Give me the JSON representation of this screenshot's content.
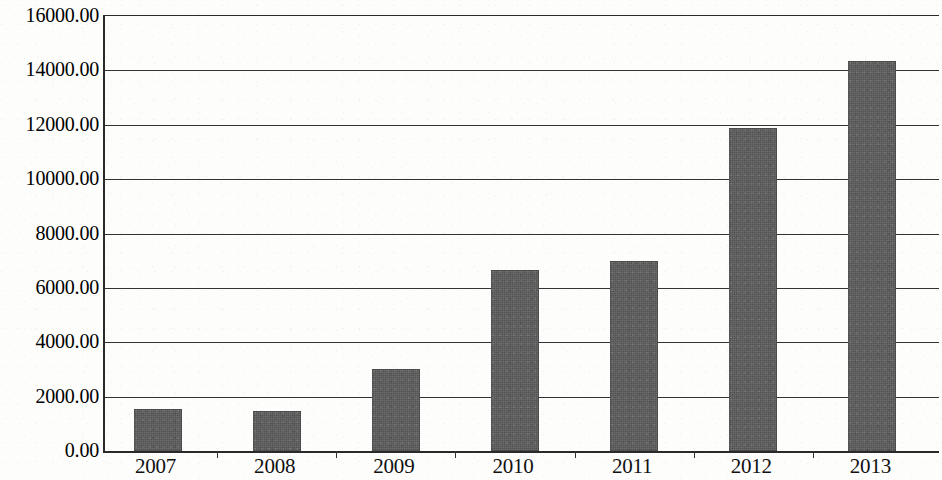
{
  "chart_data": {
    "type": "bar",
    "title": "",
    "subtitle": "",
    "xlabel": "",
    "ylabel": "",
    "categories": [
      "2007",
      "2008",
      "2009",
      "2010",
      "2011",
      "2012",
      "2013"
    ],
    "values": [
      1550,
      1480,
      3020,
      6650,
      7000,
      11880,
      14350
    ],
    "series": [
      {
        "name": "",
        "values": [
          1550,
          1480,
          3020,
          6650,
          7000,
          11880,
          14350
        ]
      }
    ],
    "ylim": [
      0,
      16000
    ],
    "ytick_values": [
      0,
      2000,
      4000,
      6000,
      8000,
      10000,
      12000,
      14000,
      16000
    ],
    "ytick_labels": [
      "0.00",
      "2000.00",
      "4000.00",
      "6000.00",
      "8000.00",
      "10000.00",
      "12000.00",
      "14000.00",
      "16000.00"
    ],
    "grid": true,
    "grid_axis": "y",
    "legend": false,
    "legend_position": "none",
    "bar_color": "#5b5b5b",
    "axis_color": "#2a2a2a",
    "grid_color": "#333333",
    "background_color": "#fdfdfc"
  }
}
